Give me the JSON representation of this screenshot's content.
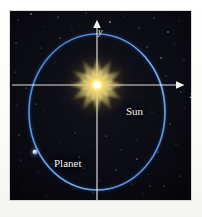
{
  "figure": {
    "background_color": "#ffffff",
    "panel_color": "#0a0a10"
  },
  "axes": {
    "x_label": "x",
    "y_label": "y",
    "axis_color": "#f0f0ea",
    "origin": {
      "x": 97,
      "y": 85
    },
    "x_axis": {
      "start_x": 12,
      "end_x": 178,
      "y": 85,
      "arrow": "right"
    },
    "y_axis": {
      "x": 97,
      "start_y": 200,
      "end_y": 22,
      "arrow": "up"
    }
  },
  "labels": {
    "sun": "Sun",
    "planet": "Planet"
  },
  "colors": {
    "orbit": "#2f6fc4",
    "orbit_highlight": "#79a9e8",
    "sun_core": "#ffffff",
    "sun_inner": "#fff6b0",
    "sun_ray": "#f2d24a",
    "planet_body": "#cfe0f2",
    "star_white": "#ffffff",
    "sky": "#0a0a10"
  },
  "chart_data": {
    "type": "scatter",
    "xlabel": "x",
    "ylabel": "y",
    "grid": false,
    "legend": null,
    "annotations": [
      "Sun",
      "Planet"
    ],
    "orbit_ellipse": {
      "center_x": 97,
      "center_y": 112,
      "semi_major_axis_vertical": 78,
      "semi_minor_axis_horizontal": 68,
      "stroke_color": "#2f6fc4",
      "stroke_width": 1.6
    },
    "points": [
      {
        "name": "Sun",
        "x": 97,
        "y": 85,
        "role": "focus"
      },
      {
        "name": "Planet",
        "x": 35,
        "y": 152,
        "role": "orbiting-body"
      }
    ]
  },
  "stars": [
    {
      "x": 18,
      "y": 20,
      "r": 0.5,
      "a": 0.55
    },
    {
      "x": 31,
      "y": 14,
      "r": 0.7,
      "a": 0.8
    },
    {
      "x": 45,
      "y": 27,
      "r": 0.4,
      "a": 0.45
    },
    {
      "x": 58,
      "y": 17,
      "r": 0.6,
      "a": 0.6
    },
    {
      "x": 72,
      "y": 30,
      "r": 0.45,
      "a": 0.5
    },
    {
      "x": 86,
      "y": 13,
      "r": 0.5,
      "a": 0.5
    },
    {
      "x": 110,
      "y": 22,
      "r": 0.8,
      "a": 0.85
    },
    {
      "x": 124,
      "y": 16,
      "r": 0.45,
      "a": 0.5
    },
    {
      "x": 139,
      "y": 28,
      "r": 0.6,
      "a": 0.65
    },
    {
      "x": 154,
      "y": 18,
      "r": 0.5,
      "a": 0.55
    },
    {
      "x": 168,
      "y": 32,
      "r": 0.7,
      "a": 0.7
    },
    {
      "x": 179,
      "y": 21,
      "r": 0.45,
      "a": 0.5
    },
    {
      "x": 16,
      "y": 43,
      "r": 0.6,
      "a": 0.6
    },
    {
      "x": 29,
      "y": 56,
      "r": 0.45,
      "a": 0.45
    },
    {
      "x": 41,
      "y": 48,
      "r": 0.5,
      "a": 0.5
    },
    {
      "x": 55,
      "y": 62,
      "r": 0.4,
      "a": 0.4
    },
    {
      "x": 147,
      "y": 47,
      "r": 0.55,
      "a": 0.6
    },
    {
      "x": 161,
      "y": 58,
      "r": 0.7,
      "a": 0.75
    },
    {
      "x": 174,
      "y": 44,
      "r": 0.45,
      "a": 0.5
    },
    {
      "x": 184,
      "y": 60,
      "r": 0.5,
      "a": 0.5
    },
    {
      "x": 15,
      "y": 72,
      "r": 0.5,
      "a": 0.5
    },
    {
      "x": 26,
      "y": 88,
      "r": 0.6,
      "a": 0.55
    },
    {
      "x": 166,
      "y": 76,
      "r": 0.5,
      "a": 0.5
    },
    {
      "x": 181,
      "y": 92,
      "r": 0.6,
      "a": 0.6
    },
    {
      "x": 17,
      "y": 105,
      "r": 0.45,
      "a": 0.45
    },
    {
      "x": 30,
      "y": 118,
      "r": 0.55,
      "a": 0.55
    },
    {
      "x": 44,
      "y": 110,
      "r": 0.4,
      "a": 0.4
    },
    {
      "x": 152,
      "y": 112,
      "r": 0.5,
      "a": 0.5
    },
    {
      "x": 170,
      "y": 124,
      "r": 0.6,
      "a": 0.6
    },
    {
      "x": 185,
      "y": 108,
      "r": 0.45,
      "a": 0.45
    },
    {
      "x": 19,
      "y": 135,
      "r": 0.6,
      "a": 0.6
    },
    {
      "x": 33,
      "y": 128,
      "r": 0.4,
      "a": 0.4
    },
    {
      "x": 60,
      "y": 142,
      "r": 0.45,
      "a": 0.45
    },
    {
      "x": 75,
      "y": 133,
      "r": 0.5,
      "a": 0.5
    },
    {
      "x": 90,
      "y": 146,
      "r": 0.4,
      "a": 0.4
    },
    {
      "x": 106,
      "y": 136,
      "r": 0.55,
      "a": 0.55
    },
    {
      "x": 121,
      "y": 150,
      "r": 0.5,
      "a": 0.5
    },
    {
      "x": 137,
      "y": 140,
      "r": 0.45,
      "a": 0.45
    },
    {
      "x": 158,
      "y": 152,
      "r": 0.6,
      "a": 0.6
    },
    {
      "x": 176,
      "y": 144,
      "r": 0.5,
      "a": 0.5
    },
    {
      "x": 21,
      "y": 160,
      "r": 0.5,
      "a": 0.5
    },
    {
      "x": 38,
      "y": 172,
      "r": 0.45,
      "a": 0.45
    },
    {
      "x": 52,
      "y": 164,
      "r": 0.55,
      "a": 0.55
    },
    {
      "x": 68,
      "y": 178,
      "r": 0.4,
      "a": 0.4
    },
    {
      "x": 84,
      "y": 168,
      "r": 0.5,
      "a": 0.5
    },
    {
      "x": 100,
      "y": 181,
      "r": 0.45,
      "a": 0.45
    },
    {
      "x": 116,
      "y": 170,
      "r": 0.6,
      "a": 0.6
    },
    {
      "x": 132,
      "y": 184,
      "r": 0.5,
      "a": 0.5
    },
    {
      "x": 148,
      "y": 174,
      "r": 0.45,
      "a": 0.45
    },
    {
      "x": 164,
      "y": 186,
      "r": 0.55,
      "a": 0.55
    },
    {
      "x": 180,
      "y": 176,
      "r": 0.5,
      "a": 0.5
    },
    {
      "x": 24,
      "y": 190,
      "r": 0.45,
      "a": 0.45
    },
    {
      "x": 46,
      "y": 196,
      "r": 0.4,
      "a": 0.4
    },
    {
      "x": 93,
      "y": 193,
      "r": 0.5,
      "a": 0.5
    },
    {
      "x": 143,
      "y": 194,
      "r": 0.45,
      "a": 0.45
    },
    {
      "x": 64,
      "y": 98,
      "r": 0.4,
      "a": 0.4
    },
    {
      "x": 130,
      "y": 66,
      "r": 0.45,
      "a": 0.45
    },
    {
      "x": 49,
      "y": 81,
      "r": 0.35,
      "a": 0.35
    },
    {
      "x": 141,
      "y": 96,
      "r": 0.4,
      "a": 0.4
    },
    {
      "x": 112,
      "y": 125,
      "r": 0.4,
      "a": 0.4
    }
  ],
  "colored_stars": [
    {
      "x": 137,
      "y": 159,
      "r": 0.8,
      "color": "#d98a50"
    },
    {
      "x": 60,
      "y": 38,
      "r": 0.7,
      "color": "#c98a60"
    },
    {
      "x": 162,
      "y": 137,
      "r": 0.7,
      "color": "#b0643c"
    },
    {
      "x": 36,
      "y": 104,
      "r": 0.6,
      "color": "#8fa8d8"
    },
    {
      "x": 150,
      "y": 186,
      "r": 0.6,
      "color": "#c07a4a"
    },
    {
      "x": 79,
      "y": 157,
      "r": 0.6,
      "color": "#a6bcdf"
    }
  ]
}
